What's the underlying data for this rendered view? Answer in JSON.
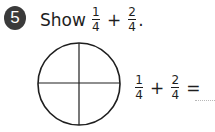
{
  "question": {
    "number": "5",
    "prompt_word": "Show",
    "expression": {
      "a": {
        "numerator": "1",
        "denominator": "4"
      },
      "operator": "+",
      "b": {
        "numerator": "2",
        "denominator": "4"
      },
      "terminator": "."
    }
  },
  "figure": {
    "shape": "circle",
    "divisions": 4,
    "shaded_parts": 0
  },
  "equation": {
    "a": {
      "numerator": "1",
      "denominator": "4"
    },
    "operator": "+",
    "b": {
      "numerator": "2",
      "denominator": "4"
    },
    "equals": "=",
    "answer": ""
  },
  "colors": {
    "badge_bg": "#3a3a3a",
    "text": "#1e1e1e",
    "blank_line": "#b8b8b8"
  }
}
